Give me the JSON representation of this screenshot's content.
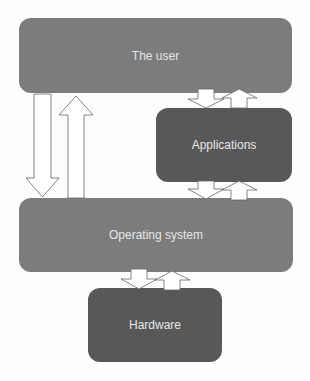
{
  "diagram": {
    "nodes": {
      "user": {
        "label": "The user",
        "color": "#7c7c7c"
      },
      "applications": {
        "label": "Applications",
        "color": "#585858"
      },
      "os": {
        "label": "Operating system",
        "color": "#7c7c7c"
      },
      "hardware": {
        "label": "Hardware",
        "color": "#585858"
      }
    },
    "edges": [
      {
        "from": "user",
        "to": "os",
        "direction": "down"
      },
      {
        "from": "os",
        "to": "user",
        "direction": "up"
      },
      {
        "from": "user",
        "to": "applications",
        "direction": "down"
      },
      {
        "from": "applications",
        "to": "user",
        "direction": "up"
      },
      {
        "from": "applications",
        "to": "os",
        "direction": "down"
      },
      {
        "from": "os",
        "to": "applications",
        "direction": "up"
      },
      {
        "from": "os",
        "to": "hardware",
        "direction": "down"
      },
      {
        "from": "hardware",
        "to": "os",
        "direction": "up"
      }
    ]
  }
}
